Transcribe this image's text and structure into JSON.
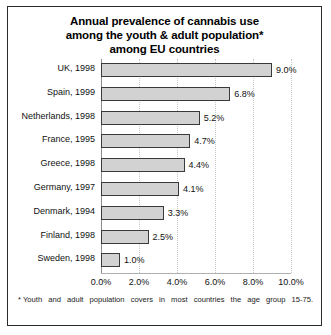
{
  "chart_data": {
    "type": "bar",
    "orientation": "horizontal",
    "title": "Annual prevalence of cannabis use among the youth & adult population* among EU countries",
    "title_lines": [
      "Annual prevalence of cannabis use",
      "among the youth & adult population*",
      "among EU countries"
    ],
    "categories": [
      "UK, 1998",
      "Spain, 1999",
      "Netherlands, 1998",
      "France, 1995",
      "Greece, 1998",
      "Germany, 1997",
      "Denmark, 1994",
      "Finland, 1998",
      "Sweden, 1998"
    ],
    "values": [
      9.0,
      6.8,
      5.2,
      4.7,
      4.4,
      4.1,
      3.3,
      2.5,
      1.0
    ],
    "value_labels": [
      "9.0%",
      "6.8%",
      "5.2%",
      "4.7%",
      "4.4%",
      "4.1%",
      "3.3%",
      "2.5%",
      "1.0%"
    ],
    "xlabel": "",
    "ylabel": "",
    "xlim": [
      0,
      10
    ],
    "xticks": [
      0,
      2,
      4,
      6,
      8,
      10
    ],
    "xtick_labels": [
      "0.0%",
      "2.0%",
      "4.0%",
      "6.0%",
      "8.0%",
      "10.0%"
    ],
    "grid": true,
    "legend": false,
    "bar_fill_color": "#d2d2d2",
    "bar_border_color": "#3a3a3a"
  },
  "footnote": {
    "marker": "*",
    "text": "Youth and adult population covers in most countries the age group 15-75."
  }
}
